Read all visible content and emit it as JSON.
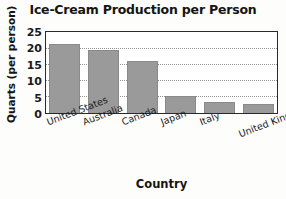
{
  "chart_data": {
    "type": "bar",
    "title": "Ice-Cream Production per Person",
    "xlabel": "Country",
    "ylabel": "Quarts (per person)",
    "categories": [
      "United States",
      "Australia",
      "Canada",
      "Japan",
      "Italy",
      "United Kingdom"
    ],
    "values": [
      21.5,
      19.8,
      16.2,
      5.2,
      3.4,
      2.9
    ],
    "ylim": [
      0,
      25
    ],
    "yticks": [
      25,
      20,
      15,
      10,
      5,
      0
    ],
    "grid": true,
    "grid_axis": "y",
    "legend": null,
    "bar_color": "#9a9a9a",
    "axis_color": "#2a2a2a",
    "background_color": "#fdfdfc",
    "xtick_rotation": -21
  }
}
